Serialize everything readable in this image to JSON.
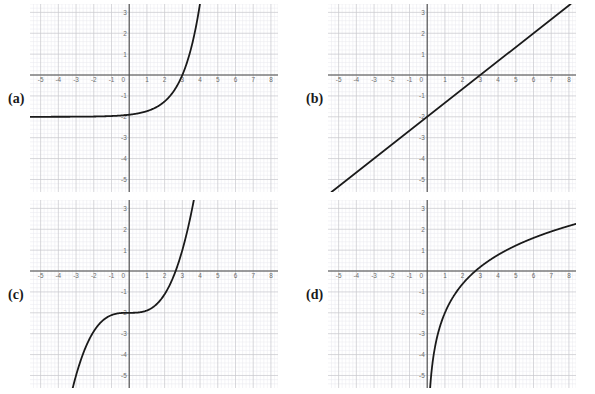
{
  "figure": {
    "title": "",
    "background": "#ffffff",
    "panel_count": 4
  },
  "style": {
    "axis_color": "#4d4d4d",
    "curve_color": "#1a1a1a",
    "major_grid_color": "#c9c9cf",
    "minor_grid_color": "#e8e8ee",
    "tick_label_color": "#6b6b6b",
    "label_color": "#1a1a1a"
  },
  "axes": {
    "x_min": -5.6,
    "x_max": 8.4,
    "y_min": -5.6,
    "y_max": 3.4,
    "x_ticks": [
      -5,
      -4,
      -3,
      -2,
      -1,
      0,
      1,
      2,
      3,
      4,
      5,
      6,
      7,
      8
    ],
    "y_ticks": [
      3,
      2,
      1,
      -1,
      -2,
      -3,
      -4,
      -5
    ],
    "x_tick_labels": [
      "-5",
      "-4",
      "-3",
      "-2",
      "-1",
      "0",
      "1",
      "2",
      "3",
      "4",
      "5",
      "6",
      "7",
      "8"
    ],
    "y_tick_labels": [
      "3",
      "2",
      "1",
      "-1",
      "-2",
      "-3",
      "-4",
      "-5"
    ],
    "origin_label": "0",
    "minor_divisions": 5,
    "grid": true,
    "legend": "none"
  },
  "panels": [
    {
      "id": "a",
      "label": "(a)",
      "label_x": 8,
      "label_y": 92,
      "plot_x": 30,
      "plot_y": 4,
      "curve_color": "#1a1a1a"
    },
    {
      "id": "b",
      "label": "(b)",
      "label_x": 306,
      "label_y": 92,
      "plot_x": 328,
      "plot_y": 4,
      "curve_color": "#1a1a1a"
    },
    {
      "id": "c",
      "label": "(c)",
      "label_x": 8,
      "label_y": 288,
      "plot_x": 30,
      "plot_y": 200,
      "curve_color": "#1a1a1a"
    },
    {
      "id": "d",
      "label": "(d)",
      "label_x": 306,
      "label_y": 288,
      "plot_x": 328,
      "plot_y": 200,
      "curve_color": "#1a1a1a"
    }
  ],
  "chart_data": [
    {
      "panel": "a",
      "type": "line",
      "title": "",
      "xlabel": "",
      "ylabel": "",
      "xlim": [
        -5.6,
        8.4
      ],
      "ylim": [
        -5.6,
        3.4
      ],
      "grid": true,
      "legend": "none",
      "description": "Exponential growth curve with horizontal asymptote y = -2; crosses x-axis near x = 3.",
      "function": "y = -2 + e^(x-3) * 2",
      "x_intercept": 3,
      "y_intercept": -2,
      "asymptote_y": -2,
      "series": [
        {
          "name": "exponential",
          "x": [
            -5.6,
            -5.0,
            -4.0,
            -3.0,
            -2.0,
            -1.0,
            0.0,
            0.5,
            1.0,
            1.5,
            2.0,
            2.25,
            2.5,
            2.75,
            3.0,
            3.2,
            3.4,
            3.6,
            3.8,
            3.95
          ],
          "y": [
            -2.0,
            -2.0,
            -2.0,
            -1.99,
            -1.98,
            -1.95,
            -1.9,
            -1.84,
            -1.74,
            -1.58,
            -1.32,
            -1.13,
            -0.89,
            -0.57,
            -0.14,
            0.3,
            0.86,
            1.57,
            2.49,
            3.35
          ]
        }
      ]
    },
    {
      "panel": "b",
      "type": "line",
      "title": "",
      "xlabel": "",
      "ylabel": "",
      "xlim": [
        -5.6,
        8.4
      ],
      "ylim": [
        -5.6,
        3.4
      ],
      "grid": true,
      "legend": "none",
      "description": "Straight line with slope 2/3 through y-intercept -2 and x-intercept 3.",
      "function": "y = (2/3)x - 2",
      "slope": 0.6667,
      "x_intercept": 3,
      "y_intercept": -2,
      "series": [
        {
          "name": "linear",
          "x": [
            -5.4,
            8.1
          ],
          "y": [
            -5.6,
            3.4
          ]
        }
      ]
    },
    {
      "panel": "c",
      "type": "line",
      "title": "",
      "xlabel": "",
      "ylabel": "",
      "xlim": [
        -5.6,
        8.4
      ],
      "ylim": [
        -5.6,
        3.4
      ],
      "grid": true,
      "legend": "none",
      "description": "Cubic curve with flat inflection point at (0, -2); crosses x-axis near x = 3.",
      "function": "y = (x/2.08)^3 - 2",
      "inflection": [
        0,
        -2
      ],
      "x_intercept": 3,
      "y_intercept": -2,
      "series": [
        {
          "name": "cubic",
          "x": [
            -3.4,
            -3.0,
            -2.5,
            -2.0,
            -1.5,
            -1.0,
            -0.5,
            0.0,
            0.5,
            1.0,
            1.5,
            2.0,
            2.5,
            3.0,
            3.3,
            3.6,
            3.85
          ],
          "y": [
            -6.3,
            -5.0,
            -3.73,
            -2.89,
            -2.37,
            -2.11,
            -2.01,
            -2.0,
            -1.99,
            -1.89,
            -1.63,
            -1.11,
            -0.26,
            1.0,
            1.99,
            3.18,
            4.34
          ]
        }
      ]
    },
    {
      "panel": "d",
      "type": "line",
      "title": "",
      "xlabel": "",
      "ylabel": "",
      "xlim": [
        -5.6,
        8.4
      ],
      "ylim": [
        -5.6,
        3.4
      ],
      "grid": true,
      "legend": "none",
      "description": "Logarithmic curve with vertical asymptote at x = 0; crosses x-axis near x = 2.7 and reaches y = 1 at x = 8.",
      "function": "y = 2*ln(x) - 2",
      "asymptote_x": 0,
      "x_intercept": 2.72,
      "series": [
        {
          "name": "logarithmic",
          "x": [
            0.06,
            0.08,
            0.1,
            0.15,
            0.2,
            0.3,
            0.5,
            0.75,
            1.0,
            1.5,
            2.0,
            2.72,
            3.5,
            4.5,
            5.5,
            6.5,
            7.5,
            8.3
          ],
          "y": [
            -5.63,
            -5.05,
            -4.61,
            -3.79,
            -3.22,
            -2.41,
            -1.39,
            -0.58,
            0.0,
            0.81,
            1.39,
            2.0,
            2.5,
            3.01,
            3.41,
            3.75,
            4.03,
            4.23
          ]
        }
      ]
    }
  ]
}
